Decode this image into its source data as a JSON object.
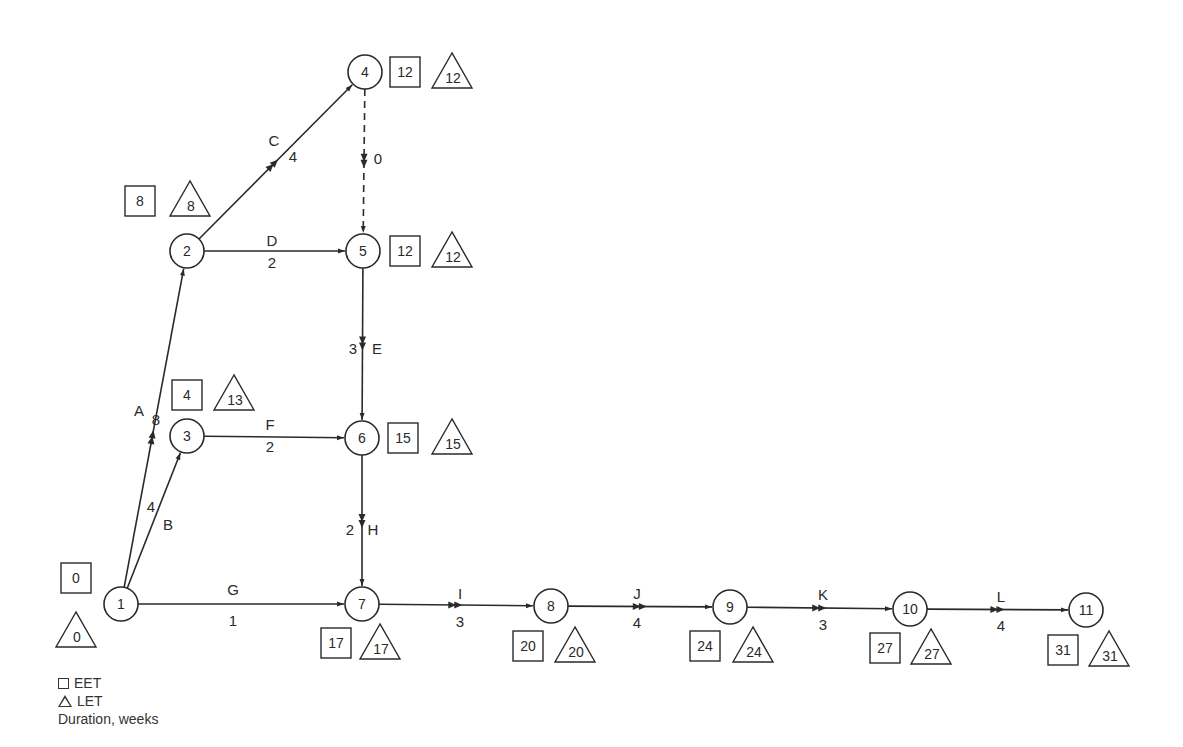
{
  "diagram": {
    "type": "activity-on-arrow network (CPM/PERT)",
    "stroke_color": "#2a2a2a",
    "nodes": [
      {
        "id": "1",
        "x": 121,
        "y": 604,
        "eet": "0",
        "let": "0",
        "eet_pos": [
          76,
          578
        ],
        "let_pos": [
          76,
          634
        ]
      },
      {
        "id": "2",
        "x": 187,
        "y": 251,
        "eet": "8",
        "let": "8",
        "eet_pos": [
          140,
          201
        ],
        "let_pos": [
          190,
          203
        ]
      },
      {
        "id": "3",
        "x": 187,
        "y": 436,
        "eet": "4",
        "let": "13",
        "eet_pos": [
          187,
          395
        ],
        "let_pos": [
          234,
          397
        ]
      },
      {
        "id": "4",
        "x": 365,
        "y": 72,
        "eet": "12",
        "let": "12",
        "eet_pos": [
          405,
          72
        ],
        "let_pos": [
          452,
          75
        ]
      },
      {
        "id": "5",
        "x": 363,
        "y": 251,
        "eet": "12",
        "let": "12",
        "eet_pos": [
          405,
          251
        ],
        "let_pos": [
          452,
          254
        ]
      },
      {
        "id": "6",
        "x": 362,
        "y": 438,
        "eet": "15",
        "let": "15",
        "eet_pos": [
          403,
          438
        ],
        "let_pos": [
          452,
          441
        ]
      },
      {
        "id": "7",
        "x": 362,
        "y": 604,
        "eet": "17",
        "let": "17",
        "eet_pos": [
          336,
          643
        ],
        "let_pos": [
          380,
          646
        ]
      },
      {
        "id": "8",
        "x": 551,
        "y": 606,
        "eet": "20",
        "let": "20",
        "eet_pos": [
          528,
          646
        ],
        "let_pos": [
          575,
          649
        ]
      },
      {
        "id": "9",
        "x": 730,
        "y": 607,
        "eet": "24",
        "let": "24",
        "eet_pos": [
          705,
          646
        ],
        "let_pos": [
          753,
          649
        ]
      },
      {
        "id": "10",
        "x": 910,
        "y": 609,
        "eet": "27",
        "let": "27",
        "eet_pos": [
          885,
          648
        ],
        "let_pos": [
          931,
          651
        ]
      },
      {
        "id": "11",
        "x": 1086,
        "y": 610,
        "eet": "31",
        "let": "31",
        "eet_pos": [
          1063,
          650
        ],
        "let_pos": [
          1109,
          653
        ]
      }
    ],
    "activities": [
      {
        "label": "A",
        "duration": "8",
        "from": "1",
        "to": "2",
        "critical": true,
        "dummy": false,
        "label_pos": [
          139,
          412
        ],
        "dur_pos": [
          156,
          421
        ]
      },
      {
        "label": "B",
        "duration": "4",
        "from": "1",
        "to": "3",
        "critical": false,
        "dummy": false,
        "label_pos": [
          168,
          526
        ],
        "dur_pos": [
          151,
          508
        ]
      },
      {
        "label": "C",
        "duration": "4",
        "from": "2",
        "to": "4",
        "critical": true,
        "dummy": false,
        "label_pos": [
          274,
          142
        ],
        "dur_pos": [
          293,
          158
        ]
      },
      {
        "label": "D",
        "duration": "2",
        "from": "2",
        "to": "5",
        "critical": false,
        "dummy": false,
        "label_pos": [
          272,
          242
        ],
        "dur_pos": [
          272,
          264
        ]
      },
      {
        "label": "",
        "duration": "0",
        "from": "4",
        "to": "5",
        "critical": true,
        "dummy": true,
        "label_pos": [
          0,
          0
        ],
        "dur_pos": [
          378,
          160
        ]
      },
      {
        "label": "E",
        "duration": "3",
        "from": "5",
        "to": "6",
        "critical": true,
        "dummy": false,
        "label_pos": [
          377,
          350
        ],
        "dur_pos": [
          353,
          350
        ]
      },
      {
        "label": "F",
        "duration": "2",
        "from": "3",
        "to": "6",
        "critical": false,
        "dummy": false,
        "label_pos": [
          270,
          426
        ],
        "dur_pos": [
          270,
          448
        ]
      },
      {
        "label": "G",
        "duration": "1",
        "from": "1",
        "to": "7",
        "critical": false,
        "dummy": false,
        "label_pos": [
          233,
          591
        ],
        "dur_pos": [
          233,
          622
        ]
      },
      {
        "label": "H",
        "duration": "2",
        "from": "6",
        "to": "7",
        "critical": true,
        "dummy": false,
        "label_pos": [
          373,
          531
        ],
        "dur_pos": [
          350,
          531
        ]
      },
      {
        "label": "I",
        "duration": "3",
        "from": "7",
        "to": "8",
        "critical": true,
        "dummy": false,
        "label_pos": [
          460,
          595
        ],
        "dur_pos": [
          460,
          623
        ]
      },
      {
        "label": "J",
        "duration": "4",
        "from": "8",
        "to": "9",
        "critical": true,
        "dummy": false,
        "label_pos": [
          637,
          595
        ],
        "dur_pos": [
          637,
          624
        ]
      },
      {
        "label": "K",
        "duration": "3",
        "from": "9",
        "to": "10",
        "critical": true,
        "dummy": false,
        "label_pos": [
          823,
          596
        ],
        "dur_pos": [
          823,
          626
        ]
      },
      {
        "label": "L",
        "duration": "4",
        "from": "10",
        "to": "11",
        "critical": true,
        "dummy": false,
        "label_pos": [
          1001,
          598
        ],
        "dur_pos": [
          1001,
          627
        ]
      }
    ]
  },
  "legend": {
    "eet_label": "EET",
    "let_label": "LET",
    "duration_label": "Duration, weeks"
  }
}
